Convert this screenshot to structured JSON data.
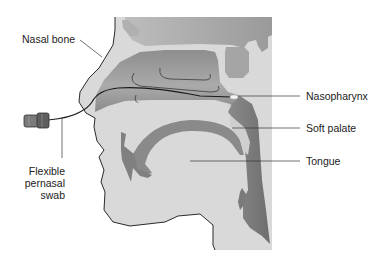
{
  "labels": {
    "nasal_bone": "Nasal bone",
    "nasopharynx": "Nasopharynx",
    "soft_palate": "Soft palate",
    "tongue": "Tongue",
    "swab_line1": "Flexible",
    "swab_line2": "pernasal",
    "swab_line3": "swab"
  },
  "colors": {
    "background": "#ffffff",
    "tissue_light": "#d9d9d9",
    "cavity_mid": "#a8a8a8",
    "airway_dark": "#7a7a7a",
    "outline": "#2a2a2a",
    "leader": "#333333"
  }
}
